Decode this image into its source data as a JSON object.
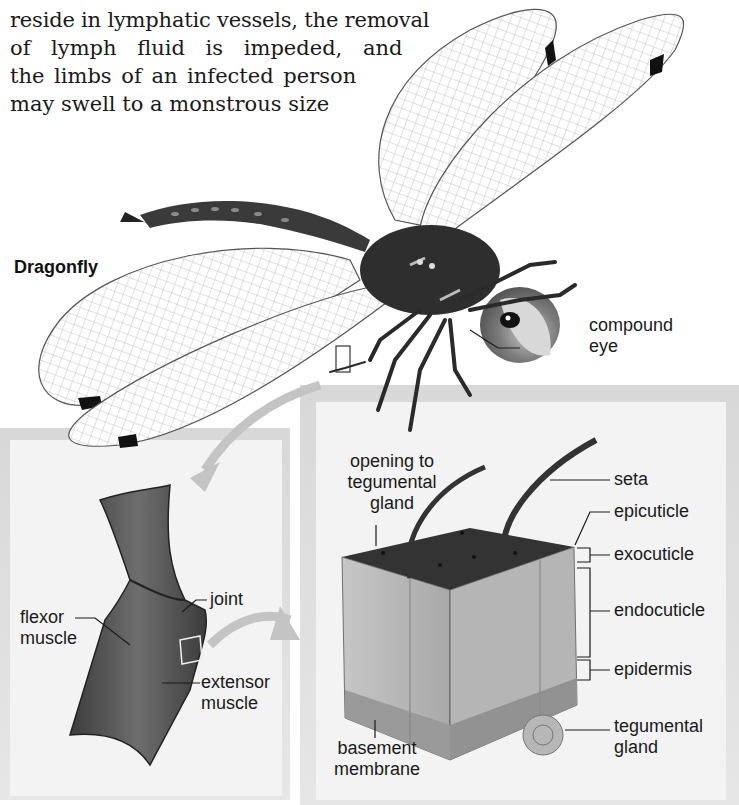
{
  "body_text": {
    "lines": [
      "reside in lymphatic vessels, the removal",
      "of lymph fluid is impeded, and",
      "the limbs of an infected person",
      "may swell to a monstrous size"
    ]
  },
  "figure": {
    "title": "Dragonfly",
    "dragonfly_labels": {
      "compound_eye_line1": "compound",
      "compound_eye_line2": "eye"
    },
    "leg_joint_panel": {
      "joint": "joint",
      "flexor_line1": "flexor",
      "flexor_line2": "muscle",
      "extensor_line1": "extensor",
      "extensor_line2": "muscle"
    },
    "cuticle_panel": {
      "opening_line1": "opening to",
      "opening_line2": "tegumental",
      "opening_line3": "gland",
      "seta": "seta",
      "epicuticle": "epicuticle",
      "exocuticle": "exocuticle",
      "endocuticle": "endocuticle",
      "epidermis": "epidermis",
      "tegumental_gland_line1": "tegumental",
      "tegumental_gland_line2": "gland",
      "basement_line1": "basement",
      "basement_line2": "membrane"
    },
    "colors": {
      "panel_bg": "#f2f2f2",
      "panel_border": "#cfcfcf",
      "arrow": "#c4c4c4",
      "cuticle_top": "#3a3a3a",
      "cuticle_side": "#bdbdbd",
      "leg": "#4a4a4a"
    }
  }
}
